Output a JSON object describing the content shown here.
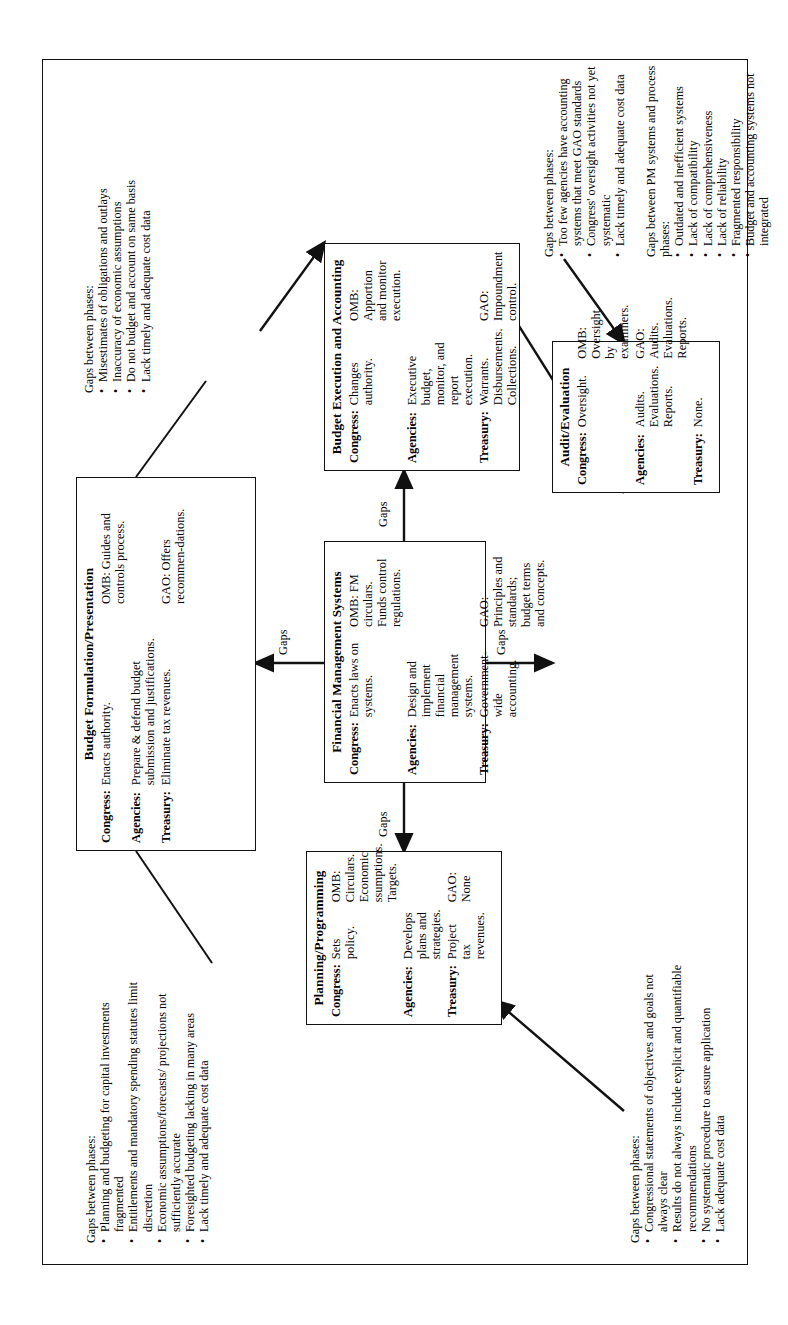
{
  "figure": {
    "orientation": "rotated-90-ccw",
    "connector_label": "Gaps"
  },
  "boxes": {
    "planning": {
      "title": "Planning/Programming",
      "rows": [
        {
          "label": "Congress:",
          "col1": "Sets policy.",
          "col2": "OMB: Circulars. Economic ssumptions. Targets."
        },
        {
          "label": "Agencies:",
          "col1": "Develops plans and strategies.",
          "col2": ""
        },
        {
          "label": "Treasury:",
          "col1": "Project tax revenues.",
          "col2": "GAO: None"
        }
      ]
    },
    "fms": {
      "title": "Financial Management Systems",
      "rows": [
        {
          "label": "Congress:",
          "col1": "Enacts laws on systems.",
          "col2": "OMB: FM circulars. Funds control regulations."
        },
        {
          "label": "Agencies:",
          "col1": "Design and implement financial management systems.",
          "col2": ""
        },
        {
          "label": "Treasury:",
          "col1": "Government-wide accounting.",
          "col2": "GAO: Principles and standards; budget terms and concepts."
        }
      ]
    },
    "formulation": {
      "title": "Budget Formulation/Presentation",
      "rows": [
        {
          "label": "Congress:",
          "col1": "Enacts authority.",
          "col2": "OMB: Guides and controls process."
        },
        {
          "label": "Agencies:",
          "col1": "Prepare & defend budget submission and justifications.",
          "col2": ""
        },
        {
          "label": "Treasury:",
          "col1": "Eliminate tax revenues.",
          "col2": "GAO: Offers recommen-dations."
        }
      ]
    },
    "execution": {
      "title": "Budget Execution and Accounting",
      "rows": [
        {
          "label": "Congress:",
          "col1": "Changes authority.",
          "col2": "OMB: Apportion and monitor execution."
        },
        {
          "label": "Agencies:",
          "col1": "Executive budget, monitor, and report execution.",
          "col2": ""
        },
        {
          "label": "Treasury:",
          "col1": "Warrants. Disbursements. Collections.",
          "col2": "GAO: Impoundment control."
        }
      ]
    },
    "audit": {
      "title": "Audit/Evaluation",
      "rows": [
        {
          "label": "Congress:",
          "col1": "Oversight.",
          "col2": "OMB: Oversight by examiners."
        },
        {
          "label": "Agencies:",
          "col1": "Audits. Evaluations. Reports.",
          "col2": "GAO: Audits. Evaluations. Reports."
        },
        {
          "label": "Treasury:",
          "col1": "None.",
          "col2": ""
        }
      ]
    }
  },
  "gap_lists": {
    "formulation_gaps": {
      "heading": "Gaps between phases:",
      "items": [
        "Planning and budgeting for capital investments fragmented",
        "Entitlements and mandatory spending statutes limit discretion",
        "Economic assumptions/forecasts/ projections not sufficiently accurate",
        "Foresighted budgeting lacking in many areas",
        "Lack timely and adequate cost data"
      ]
    },
    "execution_gaps": {
      "heading": "Gaps between phases:",
      "items": [
        "Misestimates of obligations and outlays",
        "Inaccuracy of economic assumptions",
        "Do not budget and account on same basis",
        "Lack timely and adequate cost data"
      ]
    },
    "planning_gaps": {
      "heading": "Gaps between phases:",
      "items": [
        "Congressional statements of objectives and goals not always clear",
        "Results do not always include explicit and quantifiable recommendations",
        "No systematic procedure to assure application",
        "Lack adequate cost data"
      ]
    },
    "audit_gaps": {
      "heading": "Gaps between phases:",
      "items": [
        "Too few agencies have accounting systems that meet GAO standards",
        "Congress' oversight activities not yet systematic",
        "Lack timely and adequate cost data"
      ]
    },
    "pm_gaps": {
      "heading": "Gaps between PM systems and process phases:",
      "items": [
        "Outdated and inefficient systems",
        "Lack of compatibility",
        "Lack of comprehensiveness",
        "Lack of reliability",
        "Fragmented responsibility",
        "Budget and accounting systems not integrated"
      ]
    }
  }
}
